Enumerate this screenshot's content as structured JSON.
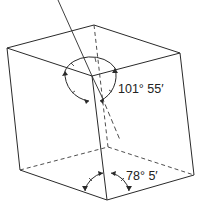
{
  "figure": {
    "angles": {
      "obtuse": "101° 55′",
      "acute": "78° 5′"
    },
    "colors": {
      "line": "#2a2a2a",
      "background": "#ffffff"
    }
  }
}
